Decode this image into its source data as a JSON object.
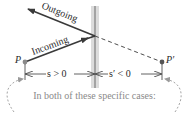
{
  "diagram": {
    "type": "plane-mirror-reflection",
    "rays": {
      "incoming_label": "Incoming",
      "outgoing_label": "Outgoing"
    },
    "points": {
      "object_label": "P",
      "image_label": "P′"
    },
    "distances": {
      "object_distance_label": "s > 0",
      "image_distance_label": "s′ < 0"
    },
    "caption": "In both of these specific cases:",
    "colors": {
      "ray": "#3a3a3a",
      "mirror_band": "#d8d8d8",
      "mirror_line": "#6a6a6a",
      "point": "#7a7a7a",
      "caption_text": "#8a8a8a",
      "dashed_curve": "#9a9a9a"
    }
  }
}
